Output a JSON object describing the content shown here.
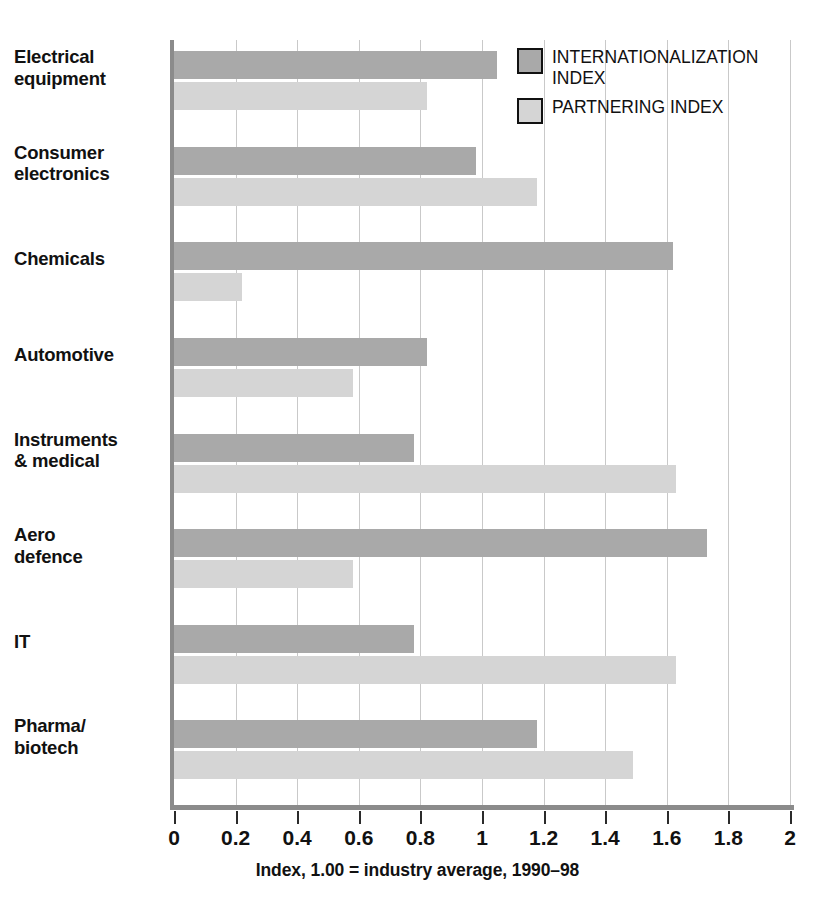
{
  "chart_data": {
    "type": "bar",
    "orientation": "horizontal",
    "title": "",
    "subtitle": "",
    "xlabel": "Index, 1.00 = industry average, 1990–98",
    "ylabel": "",
    "xlim": [
      0,
      2
    ],
    "xticks": [
      0,
      0.2,
      0.4,
      0.6,
      0.8,
      1,
      1.2,
      1.4,
      1.6,
      1.8,
      2
    ],
    "xtick_labels": [
      "0",
      "0.2",
      "0.4",
      "0.6",
      "0.8",
      "1",
      "1.2",
      "1.4",
      "1.6",
      "1.8",
      "2"
    ],
    "grid": true,
    "grid_axis": "x",
    "legend_position": "top-right",
    "categories": [
      "Electrical\nequipment",
      "Consumer\nelectronics",
      "Chemicals",
      "Automotive",
      "Instruments\n& medical",
      "Aero\ndefence",
      "IT",
      "Pharma/\nbiotech"
    ],
    "series": [
      {
        "name": "INTERNATIONALIZATION\nINDEX",
        "color": "#a9a9a9",
        "values": [
          1.05,
          0.98,
          1.62,
          0.82,
          0.78,
          1.73,
          0.78,
          1.18
        ]
      },
      {
        "name": "PARTNERING INDEX",
        "color": "#d5d5d5",
        "values": [
          0.82,
          1.18,
          0.22,
          0.58,
          1.63,
          0.58,
          1.63,
          1.49
        ]
      }
    ]
  },
  "legend": {
    "entries": [
      {
        "label": "INTERNATIONALIZATION\nINDEX",
        "color": "#a9a9a9",
        "swatch": "internationalization"
      },
      {
        "label": "PARTNERING INDEX",
        "color": "#d5d5d5",
        "swatch": "partnering"
      }
    ]
  },
  "colors": {
    "internationalization": "#a9a9a9",
    "partnering": "#d5d5d5",
    "gridline": "#c9c9c9",
    "axis": "#8b8b8b",
    "text": "#111111",
    "background": "#ffffff"
  }
}
